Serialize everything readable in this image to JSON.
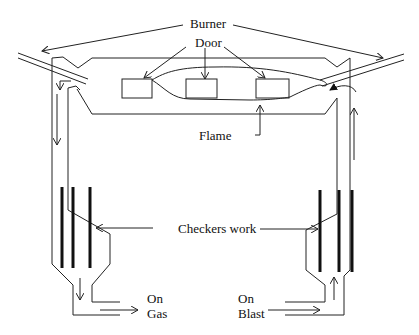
{
  "diagram": {
    "type": "open-hearth-furnace-regenerative-schematic",
    "labels": {
      "burner": "Burner",
      "door": "Door",
      "flame": "Flame",
      "checkers_work": "Checkers work",
      "on_gas_line1": "On",
      "on_gas_line2": "Gas",
      "on_blast_line1": "On",
      "on_blast_line2": "Blast"
    },
    "components": [
      {
        "id": "burner-left",
        "label": "Burner"
      },
      {
        "id": "burner-right",
        "label": "Burner"
      },
      {
        "id": "door-1",
        "label": "Door"
      },
      {
        "id": "door-2",
        "label": "Door"
      },
      {
        "id": "door-3",
        "label": "Door"
      },
      {
        "id": "flame",
        "label": "Flame"
      },
      {
        "id": "checkers-left",
        "label": "Checkers work"
      },
      {
        "id": "checkers-right",
        "label": "Checkers work"
      },
      {
        "id": "outlet-left",
        "label": "On Gas"
      },
      {
        "id": "inlet-right",
        "label": "On Blast"
      }
    ],
    "colors": {
      "line": "#222222",
      "checker": "#111111",
      "background": "#ffffff"
    }
  }
}
